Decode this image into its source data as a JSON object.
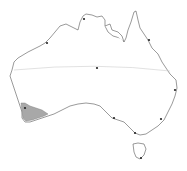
{
  "map": {
    "subject": "Australia outline",
    "colors": {
      "background": "#ffffff",
      "coastline": "#555555",
      "region_fill": "#a8a8a8",
      "tropic_line": "#cccccc",
      "city_dot": "#222222"
    },
    "highlighted_region": "south-west Western Australia",
    "tropic_line": "Tropic of Capricorn",
    "city_markers": [
      {
        "x": 84,
        "y": 19
      },
      {
        "x": 47,
        "y": 43
      },
      {
        "x": 149,
        "y": 40
      },
      {
        "x": 97,
        "y": 68
      },
      {
        "x": 175,
        "y": 90
      },
      {
        "x": 25,
        "y": 108
      },
      {
        "x": 114,
        "y": 118
      },
      {
        "x": 161,
        "y": 119
      },
      {
        "x": 135,
        "y": 133
      },
      {
        "x": 141,
        "y": 158
      }
    ]
  }
}
